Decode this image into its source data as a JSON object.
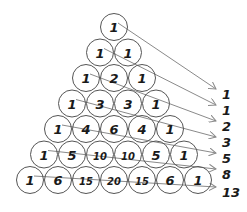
{
  "diagram": {
    "colors": {
      "circle_stroke": "#555555",
      "arrow": "#8a8a8a",
      "text": "#1a1a1a",
      "background": "#ffffff"
    },
    "rows": [
      [
        "1"
      ],
      [
        "1",
        "1"
      ],
      [
        "1",
        "2",
        "1"
      ],
      [
        "1",
        "3",
        "3",
        "1"
      ],
      [
        "1",
        "4",
        "6",
        "4",
        "1"
      ],
      [
        "1",
        "5",
        "10",
        "10",
        "5",
        "1"
      ],
      [
        "1",
        "6",
        "15",
        "20",
        "15",
        "6",
        "1"
      ]
    ],
    "diagonal_sums": [
      "1",
      "1",
      "2",
      "3",
      "5",
      "8",
      "13"
    ]
  }
}
